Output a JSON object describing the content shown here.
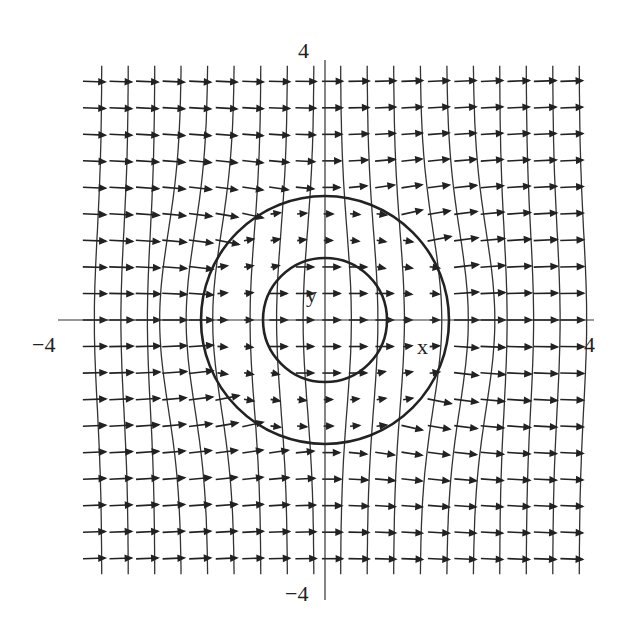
{
  "figure": {
    "type": "vector-field-with-field-lines",
    "axis_labels": {
      "x": "x",
      "y": "y"
    },
    "ticks": {
      "x_min": "−4",
      "x_max": "4",
      "y_min": "−4",
      "y_max": "4"
    },
    "range": {
      "x": [
        -4,
        4
      ],
      "y": [
        -4,
        4
      ]
    },
    "circles": [
      {
        "name": "inner",
        "radius": 1
      },
      {
        "name": "outer",
        "radius": 2
      }
    ],
    "grid": {
      "arrows_per_row": 19,
      "rows": 19
    },
    "colors": {
      "ink": "#222222",
      "background": "#ffffff"
    }
  }
}
